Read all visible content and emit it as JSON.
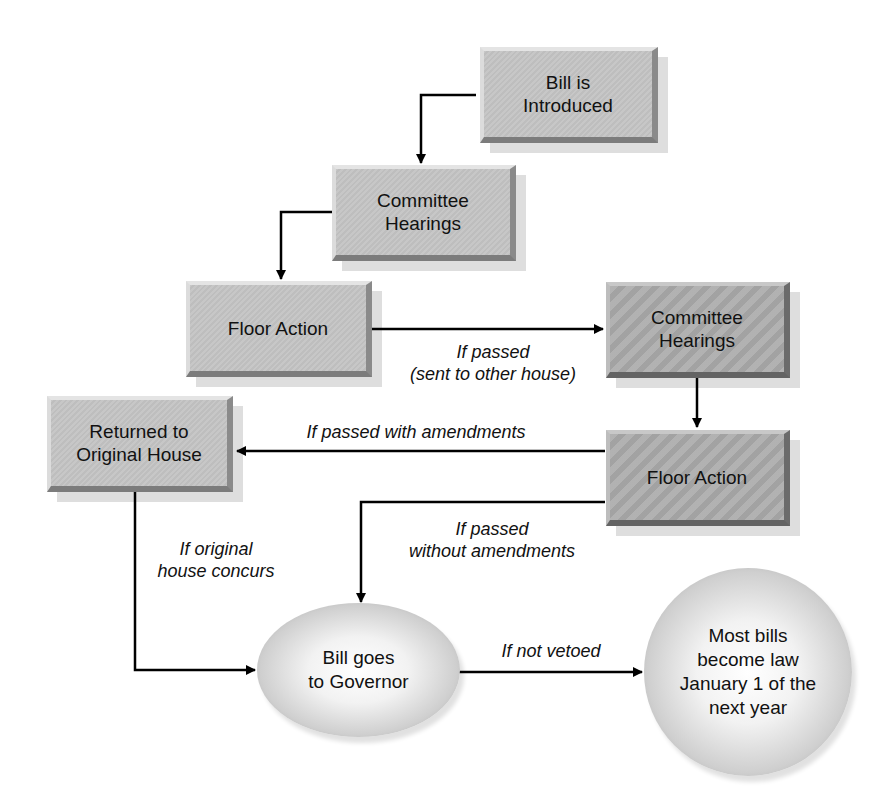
{
  "diagram": {
    "type": "flowchart",
    "nodes": {
      "bill_introduced": "Bill is\nIntroduced",
      "committee_1": "Committee\nHearings",
      "floor_1": "Floor Action",
      "committee_2": "Committee\nHearings",
      "floor_2": "Floor Action",
      "returned": "Returned to\nOriginal House",
      "governor": "Bill goes\nto Governor",
      "law": "Most bills\nbecome law\nJanuary 1 of the\nnext year"
    },
    "edge_labels": {
      "sent_to_other_house": "If passed\n(sent to other house)",
      "with_amendments": "If passed with amendments",
      "without_amendments": "If passed\nwithout amendments",
      "concurs": "If original\nhouse concurs",
      "not_vetoed": "If not vetoed"
    },
    "edges": [
      {
        "from": "bill_introduced",
        "to": "committee_1"
      },
      {
        "from": "committee_1",
        "to": "floor_1"
      },
      {
        "from": "floor_1",
        "to": "committee_2",
        "label": "sent_to_other_house"
      },
      {
        "from": "committee_2",
        "to": "floor_2"
      },
      {
        "from": "floor_2",
        "to": "returned",
        "label": "with_amendments"
      },
      {
        "from": "floor_2",
        "to": "governor",
        "label": "without_amendments"
      },
      {
        "from": "returned",
        "to": "governor",
        "label": "concurs"
      },
      {
        "from": "governor",
        "to": "law",
        "label": "not_vetoed"
      }
    ],
    "colors": {
      "first_house_box": "#c4c4c4",
      "second_house_box": "#a9a9a9",
      "line": "#000000"
    }
  }
}
